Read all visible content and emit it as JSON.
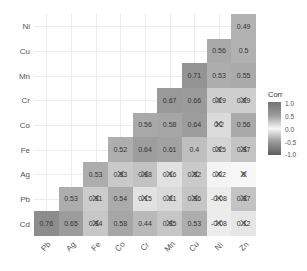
{
  "chart_data": {
    "type": "heatmap",
    "title": "",
    "xlabel": "",
    "ylabel": "",
    "x_categories": [
      "Pb",
      "Ag",
      "Fe",
      "Co",
      "Cr",
      "Mn",
      "Cu",
      "Ni",
      "Zn"
    ],
    "y_categories": [
      "Ni",
      "Cu",
      "Mn",
      "Cr",
      "Co",
      "Fe",
      "Ag",
      "Pb",
      "Cd"
    ],
    "legend": {
      "title": "Corr",
      "ticks": [
        "1.0",
        "0.5",
        "0.0",
        "-0.5",
        "-1.0"
      ],
      "range": [
        -1,
        1
      ]
    },
    "cells": [
      {
        "row": "Ni",
        "col": "Zn",
        "value": 0.49,
        "insignificant": false
      },
      {
        "row": "Cu",
        "col": "Ni",
        "value": 0.56,
        "insignificant": false
      },
      {
        "row": "Cu",
        "col": "Zn",
        "value": 0.5,
        "insignificant": false
      },
      {
        "row": "Mn",
        "col": "Cu",
        "value": 0.71,
        "insignificant": false
      },
      {
        "row": "Mn",
        "col": "Ni",
        "value": 0.53,
        "insignificant": false
      },
      {
        "row": "Mn",
        "col": "Zn",
        "value": 0.55,
        "insignificant": false
      },
      {
        "row": "Cr",
        "col": "Mn",
        "value": 0.67,
        "insignificant": false
      },
      {
        "row": "Cr",
        "col": "Cu",
        "value": 0.66,
        "insignificant": false
      },
      {
        "row": "Cr",
        "col": "Ni",
        "value": 0.29,
        "insignificant": true
      },
      {
        "row": "Cr",
        "col": "Zn",
        "value": 0.29,
        "insignificant": true
      },
      {
        "row": "Co",
        "col": "Cr",
        "value": 0.56,
        "insignificant": false
      },
      {
        "row": "Co",
        "col": "Mn",
        "value": 0.58,
        "insignificant": false
      },
      {
        "row": "Co",
        "col": "Cu",
        "value": 0.64,
        "insignificant": false
      },
      {
        "row": "Co",
        "col": "Ni",
        "value": 0.2,
        "insignificant": true
      },
      {
        "row": "Co",
        "col": "Zn",
        "value": 0.56,
        "insignificant": false
      },
      {
        "row": "Fe",
        "col": "Co",
        "value": 0.52,
        "insignificant": false
      },
      {
        "row": "Fe",
        "col": "Cr",
        "value": 0.64,
        "insignificant": false
      },
      {
        "row": "Fe",
        "col": "Mn",
        "value": 0.61,
        "insignificant": false
      },
      {
        "row": "Fe",
        "col": "Cu",
        "value": 0.4,
        "insignificant": false
      },
      {
        "row": "Fe",
        "col": "Ni",
        "value": 0.25,
        "insignificant": true
      },
      {
        "row": "Fe",
        "col": "Zn",
        "value": 0.37,
        "insignificant": true
      },
      {
        "row": "Ag",
        "col": "Fe",
        "value": 0.53,
        "insignificant": false
      },
      {
        "row": "Ag",
        "col": "Co",
        "value": 0.33,
        "insignificant": true
      },
      {
        "row": "Ag",
        "col": "Cr",
        "value": 0.38,
        "insignificant": true
      },
      {
        "row": "Ag",
        "col": "Mn",
        "value": 0.16,
        "insignificant": true
      },
      {
        "row": "Ag",
        "col": "Cu",
        "value": 0.32,
        "insignificant": true
      },
      {
        "row": "Ag",
        "col": "Ni",
        "value": 0.02,
        "insignificant": true
      },
      {
        "row": "Ag",
        "col": "Zn",
        "value": 0,
        "insignificant": true
      },
      {
        "row": "Pb",
        "col": "Ag",
        "value": 0.53,
        "insignificant": false
      },
      {
        "row": "Pb",
        "col": "Fe",
        "value": 0.31,
        "insignificant": true
      },
      {
        "row": "Pb",
        "col": "Co",
        "value": 0.54,
        "insignificant": false
      },
      {
        "row": "Pb",
        "col": "Cr",
        "value": 0.15,
        "insignificant": true
      },
      {
        "row": "Pb",
        "col": "Mn",
        "value": 0.21,
        "insignificant": true
      },
      {
        "row": "Pb",
        "col": "Cu",
        "value": 0.36,
        "insignificant": true
      },
      {
        "row": "Pb",
        "col": "Ni",
        "value": -0.08,
        "insignificant": true
      },
      {
        "row": "Pb",
        "col": "Zn",
        "value": 0.37,
        "insignificant": true
      },
      {
        "row": "Cd",
        "col": "Pb",
        "value": 0.76,
        "insignificant": false
      },
      {
        "row": "Cd",
        "col": "Ag",
        "value": 0.65,
        "insignificant": false
      },
      {
        "row": "Cd",
        "col": "Fe",
        "value": 0.34,
        "insignificant": true
      },
      {
        "row": "Cd",
        "col": "Co",
        "value": 0.58,
        "insignificant": false
      },
      {
        "row": "Cd",
        "col": "Cr",
        "value": 0.44,
        "insignificant": false
      },
      {
        "row": "Cd",
        "col": "Mn",
        "value": 0.35,
        "insignificant": true
      },
      {
        "row": "Cd",
        "col": "Cu",
        "value": 0.53,
        "insignificant": false
      },
      {
        "row": "Cd",
        "col": "Ni",
        "value": -0.08,
        "insignificant": true
      },
      {
        "row": "Cd",
        "col": "Zn",
        "value": 0.12,
        "insignificant": true
      }
    ],
    "grid": true,
    "legend_position": "right"
  },
  "legend": {
    "title": "Corr",
    "ticks": [
      "1.0",
      "0.5",
      "0.0",
      "-0.5",
      "-1.0"
    ]
  },
  "colors": {
    "positive_high": "#6e6e6e",
    "neutral": "#f7f7f7",
    "negative_low": "#5e5e5e",
    "grid": "#ececec",
    "text": "#333333",
    "axis_text": "#555555"
  }
}
